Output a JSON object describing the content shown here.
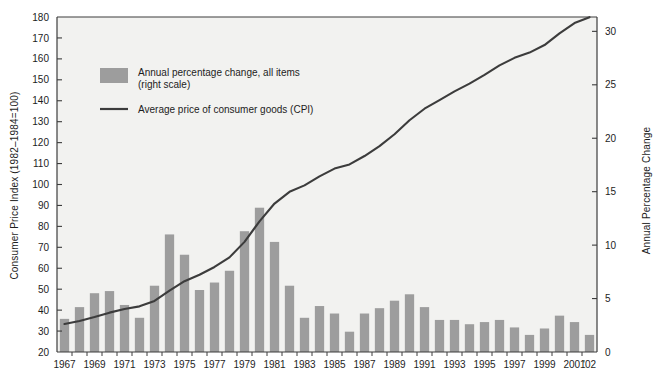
{
  "chart_data": {
    "type": "bar",
    "title": "",
    "subtitle": "",
    "xlabel": "",
    "ylabel": "Consumer Price Index (1982–1984=100)",
    "ylabel_right": "Annual Percentage Change",
    "grid": false,
    "legend_position": "upper-left-inside",
    "ylim": [
      20,
      180
    ],
    "ylim_right": [
      0,
      31.343
    ],
    "ytick_labels": [
      "20",
      "30",
      "40",
      "50",
      "60",
      "70",
      "80",
      "90",
      "100",
      "110",
      "120",
      "130",
      "140",
      "150",
      "160",
      "170",
      "180"
    ],
    "ytick_values": [
      20,
      30,
      40,
      50,
      60,
      70,
      80,
      90,
      100,
      110,
      120,
      130,
      140,
      150,
      160,
      170,
      180
    ],
    "ytick_right_labels": [
      "0",
      "5",
      "10",
      "15",
      "20",
      "25",
      "30"
    ],
    "ytick_right_values": [
      0,
      5,
      10,
      15,
      20,
      25,
      30
    ],
    "xtick_labels": [
      "1967",
      "1969",
      "1971",
      "1973",
      "1975",
      "1977",
      "1979",
      "1981",
      "1983",
      "1985",
      "1987",
      "1989",
      "1991",
      "1993",
      "1995",
      "1997",
      "1999",
      "2001",
      "'02"
    ],
    "categories": [
      1967,
      1968,
      1969,
      1970,
      1971,
      1972,
      1973,
      1974,
      1975,
      1976,
      1977,
      1978,
      1979,
      1980,
      1981,
      1982,
      1983,
      1984,
      1985,
      1986,
      1987,
      1988,
      1989,
      1990,
      1991,
      1992,
      1993,
      1994,
      1995,
      1996,
      1997,
      1998,
      1999,
      2000,
      2001,
      2002
    ],
    "series": [
      {
        "name": "Annual percentage change, all items (right scale)",
        "axis": "right",
        "units": "percent",
        "color": "#9d9d9d",
        "values": [
          3.1,
          4.2,
          5.5,
          5.7,
          4.4,
          3.2,
          6.2,
          11.0,
          9.1,
          5.8,
          6.5,
          7.6,
          11.3,
          13.5,
          10.3,
          6.2,
          3.2,
          4.3,
          3.6,
          1.9,
          3.6,
          4.1,
          4.8,
          5.4,
          4.2,
          3.0,
          3.0,
          2.6,
          2.8,
          3.0,
          2.3,
          1.6,
          2.2,
          3.4,
          2.8,
          1.6
        ]
      },
      {
        "name": "Average price of consumer goods (CPI)",
        "axis": "left",
        "units": "index",
        "color": "#3c3c3c",
        "values": [
          33.4,
          34.8,
          36.7,
          38.8,
          40.5,
          41.8,
          44.4,
          49.3,
          53.8,
          56.9,
          60.6,
          65.2,
          72.6,
          82.4,
          90.9,
          96.5,
          99.6,
          103.9,
          107.6,
          109.6,
          113.6,
          118.3,
          124.0,
          130.7,
          136.2,
          140.3,
          144.5,
          148.2,
          152.4,
          156.9,
          160.5,
          163.0,
          166.6,
          172.2,
          177.1,
          179.9
        ]
      }
    ]
  },
  "legend": {
    "items": [
      {
        "marker": "swatch",
        "label_line1": "Annual percentage change, all items",
        "label_line2": "(right scale)"
      },
      {
        "marker": "line",
        "label_line1": "Average price of consumer goods (CPI)",
        "label_line2": ""
      }
    ]
  },
  "colors": {
    "bar": "#9d9d9d",
    "line": "#3c3c3c",
    "axis": "#3c3c3c",
    "plot_background": "#f2f2f0",
    "text": "#1d1d1d"
  }
}
